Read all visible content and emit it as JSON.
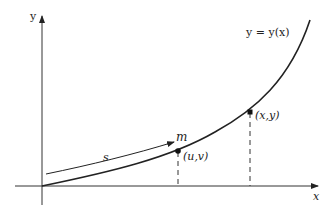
{
  "diagram": {
    "axes": {
      "x_label": "x",
      "y_label": "y"
    },
    "curve": {
      "label": "y = y(x)"
    },
    "points": [
      {
        "id": "uv",
        "label": "(u,v)"
      },
      {
        "id": "xy",
        "label": "(x,y)"
      }
    ],
    "arc": {
      "length_label": "s",
      "mass_label": "m"
    },
    "colors": {
      "stroke": "#222222",
      "background": "#ffffff"
    }
  }
}
